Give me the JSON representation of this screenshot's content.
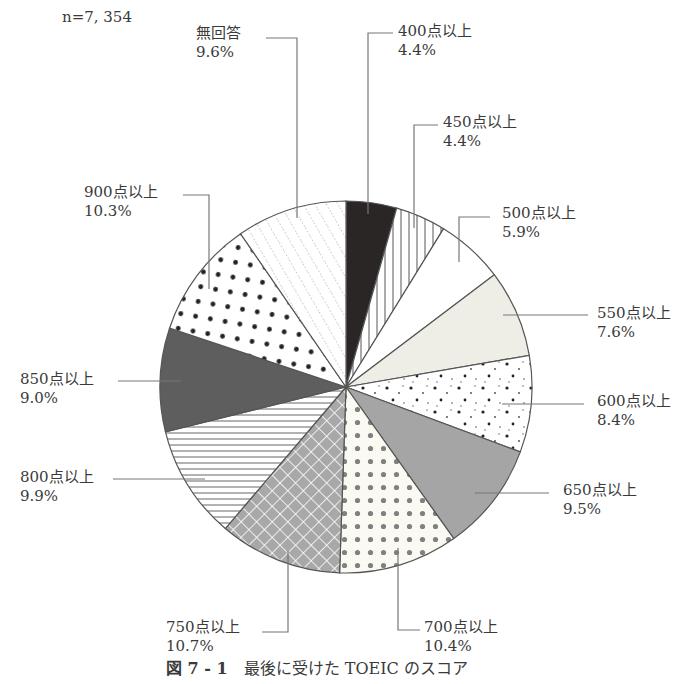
{
  "note": "n=7, 354",
  "caption": {
    "figure_no": "図 7 - 1",
    "text": "最後に受けた TOEIC のスコア"
  },
  "chart_data": {
    "type": "pie",
    "title": "最後に受けた TOEIC のスコア",
    "n": 7354,
    "start_angle_deg": 0,
    "direction": "clockwise",
    "slices": [
      {
        "label": "400点以上",
        "value": 4.4,
        "pattern": "solid-dark"
      },
      {
        "label": "450点以上",
        "value": 4.4,
        "pattern": "vertical-lines"
      },
      {
        "label": "500点以上",
        "value": 5.9,
        "pattern": "white"
      },
      {
        "label": "550点以上",
        "value": 7.6,
        "pattern": "light-fill"
      },
      {
        "label": "600点以上",
        "value": 8.4,
        "pattern": "scattered-dots"
      },
      {
        "label": "650点以上",
        "value": 9.5,
        "pattern": "solid-gray"
      },
      {
        "label": "700点以上",
        "value": 10.4,
        "pattern": "gray-dots"
      },
      {
        "label": "750点以上",
        "value": 10.7,
        "pattern": "crosshatch"
      },
      {
        "label": "800点以上",
        "value": 9.9,
        "pattern": "horizontal-lines"
      },
      {
        "label": "850点以上",
        "value": 9.0,
        "pattern": "solid-mid-dark"
      },
      {
        "label": "900点以上",
        "value": 10.3,
        "pattern": "black-dots"
      },
      {
        "label": "無回答",
        "value": 9.6,
        "pattern": "dotted-diagonal"
      }
    ]
  },
  "labels": [
    {
      "name": "400点以上",
      "pct": "4.4%"
    },
    {
      "name": "450点以上",
      "pct": "4.4%"
    },
    {
      "name": "500点以上",
      "pct": "5.9%"
    },
    {
      "name": "550点以上",
      "pct": "7.6%"
    },
    {
      "name": "600点以上",
      "pct": "8.4%"
    },
    {
      "name": "650点以上",
      "pct": "9.5%"
    },
    {
      "name": "700点以上",
      "pct": "10.4%"
    },
    {
      "name": "750点以上",
      "pct": "10.7%"
    },
    {
      "name": "800点以上",
      "pct": "9.9%"
    },
    {
      "name": "850点以上",
      "pct": "9.0%"
    },
    {
      "name": "900点以上",
      "pct": "10.3%"
    },
    {
      "name": "無回答",
      "pct": "9.6%"
    }
  ]
}
